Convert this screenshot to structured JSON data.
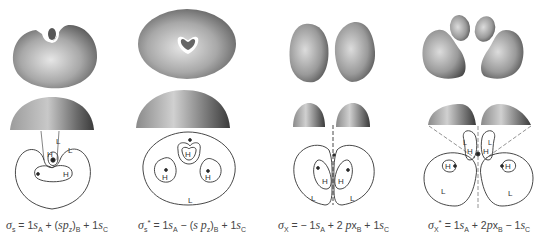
{
  "figure": {
    "panels": [
      {
        "id": "sigma_s",
        "orbital_symbol": "σ",
        "orbital_subscript": "s",
        "orbital_superscript": "",
        "formula_terms": [
          {
            "sign": "=",
            "coef": "1",
            "fn": "s",
            "sub": "A"
          },
          {
            "sign": "+",
            "coef": "",
            "fn": "(sp",
            "fn_sub": "z",
            "fn_close": ")",
            "sub": "B"
          },
          {
            "sign": "+",
            "coef": "1",
            "fn": "s",
            "sub": "C"
          }
        ],
        "formula_text": "σs = 1sA + (spz)B + 1sC",
        "contour_labels": [
          "L",
          "H",
          "L",
          "H"
        ]
      },
      {
        "id": "sigma_s_star",
        "orbital_symbol": "σ",
        "orbital_subscript": "s",
        "orbital_superscript": "*",
        "formula_text": "σs* = 1sA − (spz)B + 1sC",
        "contour_labels": [
          "H",
          "H",
          "H",
          "L"
        ]
      },
      {
        "id": "sigma_x",
        "orbital_symbol": "σ",
        "orbital_subscript": "X",
        "orbital_superscript": "",
        "formula_text": "σX = − 1sA + 2 pxB + 1sC",
        "contour_labels": [
          "H",
          "H",
          "L",
          "L"
        ]
      },
      {
        "id": "sigma_x_star",
        "orbital_symbol": "σ",
        "orbital_subscript": "X",
        "orbital_superscript": "*",
        "formula_text": "σX* = 1sA + 2pxB − 1sC",
        "contour_labels": [
          "L",
          "H",
          "L",
          "H",
          "H",
          "H",
          "L",
          "L"
        ]
      }
    ],
    "labels": {
      "high": "H",
      "low": "L"
    }
  }
}
